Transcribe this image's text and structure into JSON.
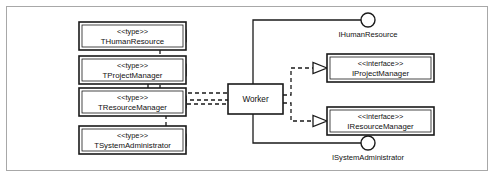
{
  "diagram": {
    "type": "uml-component-diagram",
    "frame_color": "#a8a8a8",
    "line_color": "#1a1a1a",
    "background": "#ffffff"
  },
  "component": {
    "label": "Worker"
  },
  "type_classes": [
    {
      "stereotype": "<<type>>",
      "name": "THumanResource"
    },
    {
      "stereotype": "<<type>>",
      "name": "TProjectManager"
    },
    {
      "stereotype": "<<type>>",
      "name": "TResourceManager"
    },
    {
      "stereotype": "<<type>>",
      "name": "TSystemAdministrator"
    }
  ],
  "interface_classes": [
    {
      "stereotype": "<<interface>>",
      "name": "IProjectManager"
    },
    {
      "stereotype": "<<interface>>",
      "name": "IResourceManager"
    }
  ],
  "provided_interfaces": [
    {
      "name": "IHumanResource"
    },
    {
      "name": "ISystemAdministrator"
    }
  ]
}
